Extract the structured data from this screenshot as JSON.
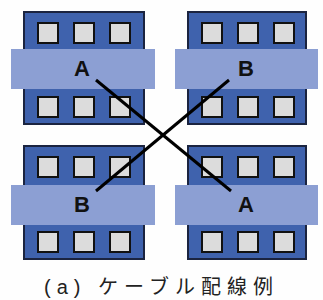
{
  "diagram": {
    "buildings": [
      {
        "id": "top-left",
        "label": "A"
      },
      {
        "id": "top-right",
        "label": "B"
      },
      {
        "id": "bottom-left",
        "label": "B"
      },
      {
        "id": "bottom-right",
        "label": "A"
      }
    ],
    "connections": [
      {
        "from": "top-left A",
        "to": "bottom-right A"
      },
      {
        "from": "top-right B",
        "to": "bottom-left B"
      }
    ],
    "caption": "(a) ケーブル配線例",
    "colors": {
      "building": "#3f62ad",
      "band": "#8c9fd3",
      "window": "#dcdcdc",
      "line": "#000000"
    }
  }
}
